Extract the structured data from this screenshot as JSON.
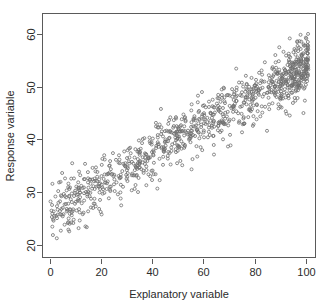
{
  "chart_data": {
    "type": "scatter",
    "title": "",
    "xlabel": "Explanatory variable",
    "ylabel": "Response variable",
    "xlim": [
      -3,
      104
    ],
    "ylim": [
      17.5,
      64
    ],
    "xticks": [
      0,
      20,
      40,
      60,
      80,
      100
    ],
    "yticks": [
      20,
      30,
      40,
      50,
      60
    ],
    "xtick_labels": [
      "0",
      "20",
      "40",
      "60",
      "80",
      "100"
    ],
    "ytick_labels": [
      "20",
      "30",
      "40",
      "50",
      "60"
    ],
    "grid": false,
    "legend": null,
    "n_points": 1000,
    "marker": "open-circle",
    "marker_color": "#6e6e6e",
    "marker_size_px": 3.0,
    "relationship": {
      "form": "linear",
      "intercept": 26.0,
      "slope": 0.28,
      "noise_sd": 2.6,
      "correlation_approx": 0.93
    },
    "x_distribution": {
      "form": "uniform-with-right-cluster",
      "min": 0,
      "max": 100,
      "cluster_center": 97,
      "cluster_weight": 0.18
    },
    "observed_ranges": {
      "x_min": 0,
      "x_max": 101,
      "y_min": 18.5,
      "y_max": 62.5
    },
    "axis_style": {
      "frame": "box",
      "tick_direction": "outward",
      "ytick_label_rotation": -90,
      "ylabel_rotation": -90,
      "frame_color": "#5a5a5a",
      "text_color": "#2b2b2b",
      "background": "#ffffff"
    },
    "plot_area_px": {
      "left": 42,
      "right": 316,
      "top": 13,
      "bottom": 258
    }
  }
}
